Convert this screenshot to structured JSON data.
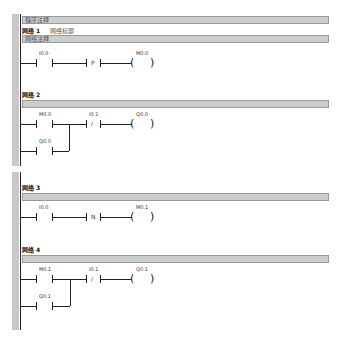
{
  "program_comment": "程序注释",
  "networks": [
    {
      "title": "网络 1",
      "note": "网络标题",
      "comment": "网络注释",
      "rung": {
        "contact1": {
          "type": "NO",
          "address": "I0.0"
        },
        "contact2": {
          "type": "P",
          "symbol": "P"
        },
        "coil": {
          "address": "M0.0"
        }
      }
    },
    {
      "title": "网络 2",
      "rung": {
        "contact1": {
          "type": "NO",
          "address": "M0.0"
        },
        "branch": {
          "type": "NO",
          "address": "Q0.0"
        },
        "contact2": {
          "type": "NC",
          "address": "I0.1",
          "symbol": "/"
        },
        "coil": {
          "address": "Q0.0"
        }
      }
    },
    {
      "title": "网络 3",
      "rung": {
        "contact1": {
          "type": "NO",
          "address": "I0.0"
        },
        "contact2": {
          "type": "N",
          "symbol": "N"
        },
        "coil": {
          "address": "M0.1"
        }
      }
    },
    {
      "title": "网络 4",
      "rung": {
        "contact1": {
          "type": "NO",
          "address": "M0.1"
        },
        "branch": {
          "type": "NO",
          "address": "Q0.1"
        },
        "contact2": {
          "type": "NC",
          "address": "I0.1",
          "symbol": "/"
        },
        "coil": {
          "address": "Q0.1"
        }
      }
    }
  ],
  "coil_symbols": {
    "open": "(",
    "close": ")"
  }
}
